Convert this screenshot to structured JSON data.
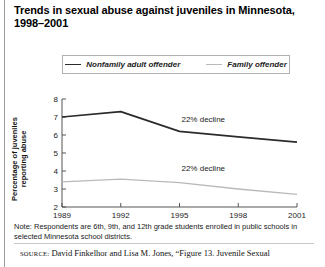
{
  "title": "Trends in sexual abuse against juveniles in Minnesota, 1998–2001",
  "legend": {
    "items": [
      {
        "label": "Nonfamily adult offender",
        "color": "#2b2b2b"
      },
      {
        "label": "Family offender",
        "color": "#b9b9b9"
      }
    ]
  },
  "note": "Note: Respondents are 6th, 9th, and 12th grade students enrolled in public schools in selected Minnesota school districts.",
  "source": {
    "kicker": "SOURCE:",
    "text": " David Finkelhor and Lisa M. Jones, “Figure 13. Juvenile Sexual"
  },
  "chart_data": {
    "type": "line",
    "title": "Trends in sexual abuse against juveniles in Minnesota, 1998–2001",
    "xlabel": "",
    "ylabel": "Percentage of juveniles reporting abuse",
    "x": [
      1989,
      1992,
      1995,
      1998,
      2001
    ],
    "xticklabels": [
      "1989",
      "1992",
      "1995",
      "1998",
      "2001"
    ],
    "yticklabels": [
      "2",
      "3",
      "4",
      "5",
      "6",
      "7",
      "8"
    ],
    "ylim": [
      2,
      8
    ],
    "xlim": [
      1989,
      2001
    ],
    "grid": false,
    "legend_position": "top",
    "series": [
      {
        "name": "Nonfamily adult offender",
        "color": "#2b2b2b",
        "values": [
          7.0,
          7.3,
          6.2,
          5.9,
          5.6
        ]
      },
      {
        "name": "Family offender",
        "color": "#b9b9b9",
        "values": [
          3.4,
          3.55,
          3.35,
          3.0,
          2.7
        ]
      }
    ],
    "annotations": [
      {
        "text": "22% decline",
        "x": 1995.1,
        "y": 6.7,
        "series": "Nonfamily adult offender"
      },
      {
        "text": "22% decline",
        "x": 1995.1,
        "y": 4.0,
        "series": "Family offender"
      }
    ]
  }
}
